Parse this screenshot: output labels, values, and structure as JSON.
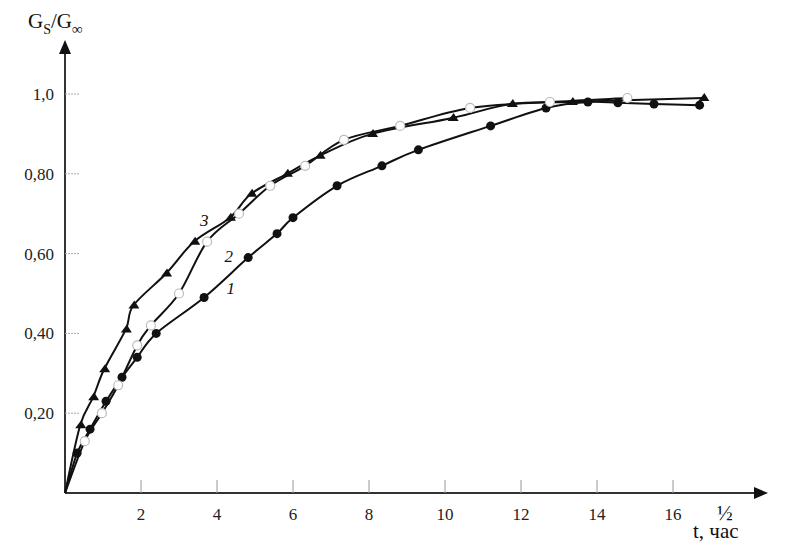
{
  "chart_data": {
    "type": "line",
    "title": "",
    "xlabel": "t, час",
    "xlabel_superscript": "½",
    "ylabel": "Gs/G∞",
    "xlim": [
      0,
      18
    ],
    "ylim": [
      0,
      1.1
    ],
    "grid": false,
    "legend": "inline curve labels 1, 2, 3",
    "x_ticks": [
      2,
      4,
      6,
      8,
      10,
      12,
      14,
      16
    ],
    "x_tick_labels": [
      "2",
      "4",
      "6",
      "8",
      "10",
      "12",
      "14",
      "16"
    ],
    "y_ticks": [
      0.2,
      0.4,
      0.6,
      0.8,
      1.0
    ],
    "y_tick_labels": [
      "0,20",
      "0,40",
      "0,60",
      "0,80",
      "1,0"
    ],
    "series": [
      {
        "name": "1",
        "marker": "filled-circle",
        "x": [
          0.32,
          0.66,
          1.08,
          1.5,
          1.9,
          2.4,
          3.66,
          4.82,
          5.58,
          6.0,
          7.16,
          8.34,
          9.3,
          11.2,
          12.66,
          13.76,
          14.55,
          15.5,
          16.7
        ],
        "y": [
          0.1,
          0.16,
          0.23,
          0.29,
          0.34,
          0.4,
          0.49,
          0.59,
          0.65,
          0.69,
          0.77,
          0.82,
          0.86,
          0.92,
          0.965,
          0.98,
          0.978,
          0.975,
          0.972
        ],
        "label_pos": {
          "x": 4.25,
          "y": 0.5
        }
      },
      {
        "name": "2",
        "marker": "open-circle",
        "x": [
          0.52,
          0.97,
          1.4,
          1.9,
          2.26,
          3.0,
          3.74,
          4.58,
          5.4,
          6.32,
          7.34,
          8.82,
          10.66,
          12.76,
          14.8
        ],
        "y": [
          0.13,
          0.2,
          0.27,
          0.37,
          0.42,
          0.5,
          0.63,
          0.7,
          0.77,
          0.82,
          0.885,
          0.92,
          0.965,
          0.98,
          0.99
        ],
        "label_pos": {
          "x": 4.2,
          "y": 0.58
        }
      },
      {
        "name": "3",
        "marker": "filled-triangle",
        "x": [
          0.4,
          0.74,
          1.03,
          1.6,
          1.8,
          2.66,
          3.4,
          4.34,
          4.9,
          5.84,
          6.7,
          8.08,
          10.2,
          11.76,
          13.34,
          16.8
        ],
        "y": [
          0.17,
          0.24,
          0.31,
          0.41,
          0.47,
          0.55,
          0.63,
          0.69,
          0.75,
          0.8,
          0.845,
          0.9,
          0.94,
          0.975,
          0.98,
          0.99
        ],
        "label_pos": {
          "x": 3.55,
          "y": 0.67
        }
      }
    ]
  },
  "axes": {
    "y_title_main": "G",
    "y_title_sub1": "S",
    "y_title_slash": "/G",
    "y_title_sub2": "∞",
    "x_title": "t, час",
    "x_title_sup": "½"
  }
}
